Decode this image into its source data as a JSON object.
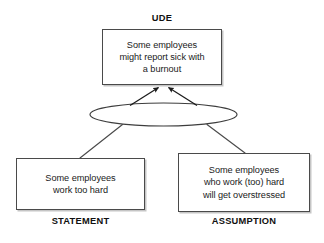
{
  "diagram": {
    "type": "current-reality-tree",
    "background_color": "#ffffff",
    "line_color": "#4a4a4a",
    "text_color": "#1a1a1a",
    "nodes": [
      {
        "id": "ude",
        "role": "effect",
        "caption": "UDE",
        "caption_position": "above",
        "text": "Some employees\nmight report sick with\na burnout"
      },
      {
        "id": "statement",
        "role": "cause",
        "caption": "STATEMENT",
        "caption_position": "below",
        "text": "Some employees\nwork too hard"
      },
      {
        "id": "assumption",
        "role": "cause",
        "caption": "ASSUMPTION",
        "caption_position": "below",
        "text": "Some employees\nwho work (too) hard\nwill get overstressed"
      }
    ],
    "connector": {
      "id": "and-connector",
      "shape": "ellipse",
      "label": ""
    },
    "edges": [
      {
        "from": "and-connector",
        "to": "ude",
        "arrow": true
      },
      {
        "from": "statement",
        "to": "and-connector",
        "arrow": false
      },
      {
        "from": "assumption",
        "to": "and-connector",
        "arrow": false
      }
    ]
  }
}
